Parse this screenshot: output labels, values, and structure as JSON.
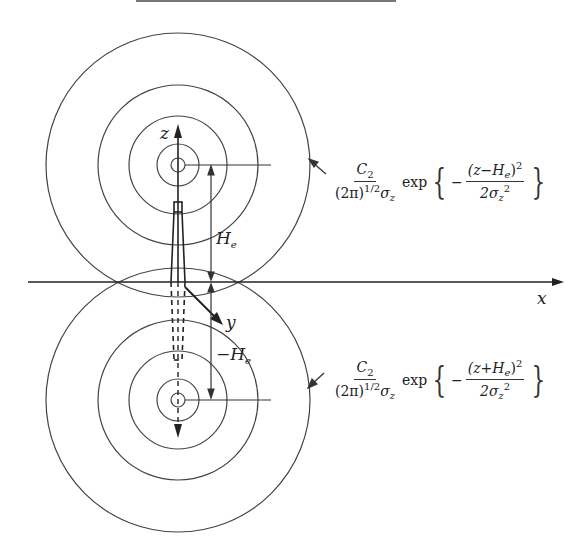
{
  "axes": {
    "x_label": "x",
    "y_label": "y",
    "z_label": "z"
  },
  "dimensions": {
    "height_label": "H",
    "height_sub": "e",
    "neg_height_label": "−H",
    "neg_height_sub": "e"
  },
  "formulas": {
    "upper": {
      "coef_num": "C",
      "coef_num_sub": "2",
      "coef_den_pre": "(2π)",
      "coef_den_sup": "1/2",
      "coef_den_sigma": "σ",
      "coef_den_sigma_sub": "z",
      "exp": "exp",
      "sign": "−",
      "num": "(z−H",
      "num_sub": "e",
      "num_post": ")",
      "num_sup": "2",
      "den": "2σ",
      "den_sub": "z",
      "den_sup": "2"
    },
    "lower": {
      "coef_num": "C",
      "coef_num_sub": "2",
      "coef_den_pre": "(2π)",
      "coef_den_sup": "1/2",
      "coef_den_sigma": "σ",
      "coef_den_sigma_sub": "z",
      "exp": "exp",
      "sign": "−",
      "num": "(z+H",
      "num_sub": "e",
      "num_post": ")",
      "num_sup": "2",
      "den": "2σ",
      "den_sub": "z",
      "den_sup": "2"
    }
  },
  "colors": {
    "line": "#333333",
    "background": "#ffffff"
  }
}
